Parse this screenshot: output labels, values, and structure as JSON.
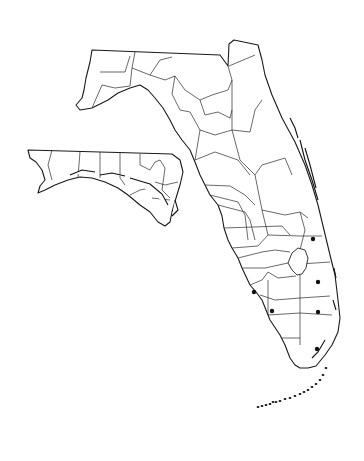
{
  "map": {
    "title": "",
    "background": "#ffffff",
    "line_color": "#1a1a1a",
    "dot_color": "#111111",
    "regions": {
      "mainland_outline": "M92,50 L220,55 L228,66 L229,44 L234,40 L258,45 L262,60 L265,75 L272,95 L282,118 L295,142 L305,165 L312,185 L318,205 L324,230 L330,255 L335,275 L338,300 L340,318 L338,332 L332,345 L325,355 L316,366 L308,368 L300,368 L295,365 L290,358 L285,345 L280,335 L270,320 L262,300 L256,292 L250,285 L242,268 L238,258 L232,248 L228,240 L224,228 L222,216 L218,205 L210,195 L205,185 L200,175 L195,162 L190,150 L182,140 L175,130 L170,120 L163,108 L155,98 L148,90 L140,85 L130,88 L118,93 L108,100 L92,108 L80,110 L76,105 L82,98 L84,90 L86,78 L90,62 Z",
      "panhandle_outline": "M28,150 L172,154 L180,160 L183,172 L180,185 L176,198 L172,212 L170,222 L165,226 L158,222 L150,212 L140,205 L128,195 L118,188 L105,182 L92,178 L80,177 L68,180 L55,185 L45,190 L38,193 L40,186 L45,180 L42,170 L36,162 L30,158 Z",
      "lake_okeechobee": "M292,253 L298,248 L305,250 L308,258 L306,268 L302,274 L297,275 L292,270 L288,263 Z"
    },
    "county_lines": [
      "M92,108 L102,85 L115,88 L130,86 L132,68 L150,75 L165,80 L175,76 L185,90 L200,100 L212,95 L228,90 L232,80 L228,66",
      "M100,72 L125,72 L130,56",
      "M132,68 L135,52",
      "M150,75 L160,60 L172,57",
      "M175,76 L172,94 L180,110 L190,112 L200,130 L195,160",
      "M200,100 L205,115 L218,112 L230,118 L232,110",
      "M232,80 L232,130 L250,132 L255,110 L262,100",
      "M229,66 L255,55",
      "M232,130 L240,160 L255,175 L262,210 L268,235",
      "M200,130 L215,135 L232,130",
      "M195,160 L215,152 L238,160 L250,175",
      "M205,185 L230,186 L245,195 L255,205",
      "M210,195 L238,202 L245,215",
      "M218,205 L245,212 L250,220 L255,240",
      "M224,228 L282,226 L290,235",
      "M255,175 L262,165 L285,158 L292,175",
      "M262,210 L285,215 L300,212 L308,218",
      "M232,248 L258,246 L268,235 L300,236 L322,236",
      "M238,258 L262,252 L275,250 L290,252",
      "M242,268 L265,268 L288,263",
      "M250,285 L262,280 L268,272 L278,278 L296,276",
      "M300,275 L300,298 L300,345",
      "M260,295 L275,300 L300,298 L330,296",
      "M268,315 L300,313 L332,315",
      "M282,338 L300,338",
      "M300,264 L330,262",
      "M268,280 L268,315",
      "M245,215 L248,240",
      "M300,212 L305,230 L300,250"
    ],
    "panhandle_county_lines": [
      "M52,150 L48,165 L52,180",
      "M80,152 L78,177",
      "M100,152 L100,178",
      "M120,152 L120,178 L125,185",
      "M140,154 L140,165 L150,170 L155,162 L160,160 L165,168 L162,190 L170,198",
      "M155,182 L165,185 L178,182",
      "M152,198 L170,200",
      "M130,195 L140,190 L150,188"
    ],
    "coastal_islands": [
      "M290,118 L295,128 L298,138",
      "M300,140 L305,160 L312,180 L318,200",
      "M305,148 L310,165 L316,188",
      "M334,268 L336,278",
      "M333,300 L336,310",
      "M325,340 L318,352 L312,358",
      "M70,175 L82,170 L95,172",
      "M100,175 L112,173 L125,176",
      "M130,178 L150,184 L162,194 L168,205",
      "M175,200 L178,210 L172,216"
    ],
    "keys": [
      [
        258,
        407
      ],
      [
        262,
        406
      ],
      [
        266,
        405
      ],
      [
        270,
        404
      ],
      [
        273,
        402
      ],
      [
        276,
        402
      ],
      [
        280,
        401
      ],
      [
        285,
        399
      ],
      [
        290,
        398
      ],
      [
        295,
        396
      ],
      [
        300,
        394
      ],
      [
        304,
        392
      ],
      [
        308,
        390
      ],
      [
        312,
        387
      ],
      [
        316,
        384
      ],
      [
        320,
        380
      ],
      [
        323,
        375
      ],
      [
        326,
        368
      ]
    ],
    "occurrence_dots": [
      {
        "cx": 313,
        "cy": 239,
        "r": 2.2
      },
      {
        "cx": 318,
        "cy": 282,
        "r": 2.2
      },
      {
        "cx": 254,
        "cy": 292,
        "r": 2.2
      },
      {
        "cx": 272,
        "cy": 311,
        "r": 2.2
      },
      {
        "cx": 318,
        "cy": 312,
        "r": 2.2
      },
      {
        "cx": 317,
        "cy": 349,
        "r": 2.2
      }
    ]
  }
}
